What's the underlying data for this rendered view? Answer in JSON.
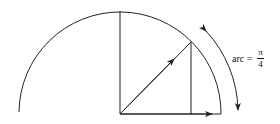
{
  "diagram": {
    "type": "unit-circle-arc",
    "label": {
      "prefix": "arc =",
      "numerator": "π",
      "denominator": "4"
    },
    "geometry": {
      "center": [
        120,
        114
      ],
      "radius": 101,
      "angle_deg": 45
    },
    "colors": {
      "stroke": "#222222",
      "background": "#ffffff"
    }
  }
}
